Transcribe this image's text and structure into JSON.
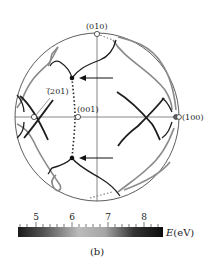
{
  "figure": {
    "caption": "(b)",
    "poles": [
      {
        "label": "(010)",
        "x": 97,
        "y": 34
      },
      {
        "label": "(001)",
        "x": 78,
        "y": 117
      },
      {
        "label": "(Ą2̅ 01)",
        "x": 34,
        "y": 117
      },
      {
        "label": "(100)",
        "x": 179,
        "y": 117
      }
    ],
    "pole_labels": {
      "p010": "(010)",
      "p001": "(001)",
      "p201": "(̅201)",
      "p100": "(100)"
    },
    "colorbar": {
      "ticks": [
        "5",
        "6",
        "7",
        "8"
      ],
      "label": "E(eV)",
      "label_var": "E",
      "label_unit": "(eV)",
      "range": [
        4.5,
        8.5
      ],
      "colors": [
        "#1a1a1a",
        "#555555",
        "#9a9a9a",
        "#bdbdbd",
        "#9a9a9a",
        "#555555",
        "#111111"
      ]
    }
  }
}
